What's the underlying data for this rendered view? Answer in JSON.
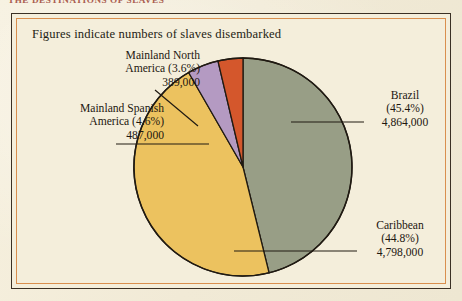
{
  "running_head": {
    "text": "THE DESTINATIONS OF SLAVES",
    "color": "#9c4436"
  },
  "caption": "Figures indicate numbers of slaves disembarked",
  "frame": {
    "outer_border_color": "#3a3024",
    "inner_rule_color": "#d98f4e",
    "background_color": "#f4eedb"
  },
  "labels": {
    "north_america": {
      "name_line1": "Mainland North",
      "name_line2": "America (3.6%)",
      "value": "389,000"
    },
    "spanish_america": {
      "name_line1": "Mainland Spanish",
      "name_line2": "America (4.6%)",
      "value": "487,000"
    },
    "brazil": {
      "name_line1": "Brazil",
      "name_line2": "(45.4%)",
      "value": "4,864,000"
    },
    "caribbean": {
      "name_line1": "Caribbean",
      "name_line2": "(44.8%)",
      "value": "4,798,000"
    }
  },
  "chart_data": {
    "type": "pie",
    "title": "The Destinations of Slaves",
    "subtitle": "Figures indicate numbers of slaves disembarked",
    "unit": "slaves disembarked",
    "start_angle_deg": 0,
    "direction": "clockwise",
    "legend": "none-inline-labels",
    "categories": [
      "Brazil",
      "Caribbean",
      "Mainland Spanish America",
      "Mainland North America"
    ],
    "values": [
      4864000,
      4798000,
      487000,
      389000
    ],
    "percentages": [
      45.4,
      44.8,
      4.6,
      3.6
    ],
    "colors": [
      "#989e86",
      "#ecc25f",
      "#b49ac2",
      "#d4572c"
    ],
    "value_labels": [
      "4,864,000",
      "4,798,000",
      "487,000",
      "389,000"
    ],
    "slice_outline_color": "#201a12",
    "slices": [
      {
        "label": "Brazil",
        "value": 4864000,
        "percent": 45.4,
        "color": "#989e86",
        "value_label": "4,864,000"
      },
      {
        "label": "Caribbean",
        "value": 4798000,
        "percent": 44.8,
        "color": "#ecc25f",
        "value_label": "4,798,000"
      },
      {
        "label": "Mainland Spanish America",
        "value": 487000,
        "percent": 4.6,
        "color": "#b49ac2",
        "value_label": "487,000"
      },
      {
        "label": "Mainland North America",
        "value": 389000,
        "percent": 3.6,
        "color": "#d4572c",
        "value_label": "389,000"
      }
    ]
  }
}
